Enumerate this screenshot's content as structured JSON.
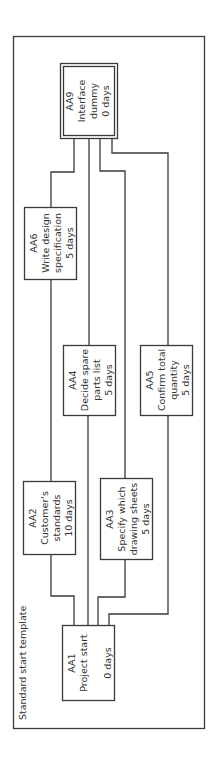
{
  "diagram": {
    "title": "Standard start template",
    "orientation": "rotated-90-ccw",
    "colors": {
      "line": "#3a3a3a",
      "text": "#333333",
      "background": "#ffffff"
    },
    "nodes": [
      {
        "id": "AA1",
        "lines": [
          "AA1",
          "Project start",
          "",
          "0 days"
        ],
        "duration": "0 days"
      },
      {
        "id": "AA2",
        "lines": [
          "AA2",
          "Customer's",
          "standards",
          "10 days"
        ],
        "duration": "10 days"
      },
      {
        "id": "AA3",
        "lines": [
          "AA3",
          "Specify which",
          "drawing sheets",
          "5 days"
        ],
        "duration": "5 days"
      },
      {
        "id": "AA4",
        "lines": [
          "AA4",
          "Decide spare",
          "parts list",
          "5 days"
        ],
        "duration": "5 days"
      },
      {
        "id": "AA5",
        "lines": [
          "AA5",
          "Confirm total",
          "quantity",
          "5 days"
        ],
        "duration": "5 days"
      },
      {
        "id": "AA6",
        "lines": [
          "AA6",
          "Write design",
          "specification",
          "5 days"
        ],
        "duration": "5 days"
      },
      {
        "id": "AA9",
        "lines": [
          "AA9",
          "Interface",
          "dummy",
          "0 days"
        ],
        "duration": "0 days"
      }
    ],
    "edges": [
      {
        "from": "AA1",
        "to": "AA2"
      },
      {
        "from": "AA2",
        "to": "AA6"
      },
      {
        "from": "AA6",
        "to": "AA9"
      },
      {
        "from": "AA1",
        "to": "AA4"
      },
      {
        "from": "AA4",
        "to": "AA9"
      },
      {
        "from": "AA1",
        "to": "AA3"
      },
      {
        "from": "AA3",
        "to": "AA9"
      },
      {
        "from": "AA1",
        "to": "AA5"
      },
      {
        "from": "AA5",
        "to": "AA9"
      }
    ]
  }
}
